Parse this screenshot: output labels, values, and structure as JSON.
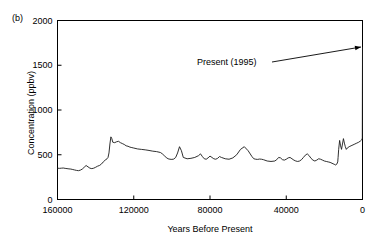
{
  "figure": {
    "panel_label": "(b)",
    "background_color": "#ffffff",
    "line_color": "#1a1a1a",
    "axis_color": "#000000",
    "text_color": "#000000"
  },
  "annotation": {
    "label": "Present (1995)",
    "text_x": 197,
    "text_y": 57,
    "line_from_x": 272,
    "line_from_y": 62,
    "arrow_to_x": 361,
    "arrow_to_y": 47
  },
  "chart_data": {
    "type": "line",
    "title": "",
    "subtitle": "",
    "xlabel": "Years Before Present",
    "ylabel": "Concentration (ppbv)",
    "xlim": [
      160000,
      0
    ],
    "ylim": [
      0,
      2000
    ],
    "x_inverted": true,
    "grid": false,
    "legend": null,
    "xticks": [
      160000,
      120000,
      80000,
      40000,
      0
    ],
    "xtick_labels": [
      "160000",
      "120000",
      "80000",
      "40000",
      "0"
    ],
    "yticks": [
      0,
      500,
      1000,
      1500,
      2000
    ],
    "ytick_labels": [
      "0",
      "500",
      "1000",
      "1500",
      "2000"
    ],
    "tick_direction": "in",
    "annotations": [
      {
        "text": "Present (1995)",
        "points_to_x": 0,
        "points_to_y": 1700
      }
    ],
    "series": [
      {
        "name": "Methane concentration",
        "units": "ppbv",
        "x": [
          160000,
          159000,
          158000,
          157000,
          156000,
          155000,
          154000,
          153000,
          152000,
          151000,
          150000,
          149000,
          148000,
          147000,
          146000,
          145000,
          144000,
          143000,
          142000,
          141000,
          140000,
          139000,
          138000,
          137000,
          136000,
          135000,
          134000,
          133500,
          133000,
          132500,
          132000,
          131500,
          131000,
          130000,
          129000,
          128000,
          127000,
          126000,
          125000,
          124000,
          123000,
          122000,
          121000,
          120000,
          118000,
          116000,
          114000,
          112000,
          110000,
          108000,
          106000,
          105000,
          104000,
          103000,
          102000,
          101000,
          100000,
          99000,
          98000,
          97000,
          96000,
          95000,
          94000,
          92000,
          90000,
          88000,
          86000,
          85000,
          84000,
          83000,
          82000,
          81000,
          80000,
          79000,
          78000,
          77000,
          76000,
          75000,
          74000,
          72000,
          70000,
          68000,
          66000,
          64000,
          62000,
          60000,
          58000,
          57000,
          56000,
          55000,
          54000,
          53000,
          52000,
          50000,
          48000,
          46000,
          45000,
          44000,
          43000,
          42000,
          41000,
          40000,
          39000,
          38000,
          37000,
          36000,
          35000,
          34000,
          33000,
          32000,
          31000,
          30000,
          29000,
          28000,
          27000,
          26000,
          25000,
          24000,
          23000,
          22000,
          21000,
          20000,
          19000,
          18000,
          17000,
          16000,
          15000,
          14500,
          14000,
          13500,
          13000,
          12800,
          12500,
          12000,
          11500,
          11000,
          10500,
          10000,
          9500,
          9000,
          8500,
          8000,
          7000,
          6000,
          5000,
          4000,
          3000,
          2000,
          1000,
          500,
          200,
          100,
          50,
          0
        ],
        "y": [
          350,
          348,
          350,
          352,
          348,
          345,
          342,
          340,
          335,
          330,
          325,
          322,
          328,
          340,
          360,
          380,
          365,
          350,
          345,
          350,
          360,
          372,
          380,
          395,
          420,
          440,
          455,
          470,
          520,
          620,
          700,
          680,
          640,
          635,
          645,
          650,
          635,
          625,
          615,
          600,
          595,
          585,
          580,
          575,
          565,
          560,
          555,
          548,
          540,
          535,
          525,
          510,
          490,
          470,
          455,
          450,
          448,
          452,
          470,
          520,
          590,
          545,
          470,
          455,
          460,
          470,
          490,
          510,
          480,
          455,
          450,
          465,
          485,
          470,
          455,
          450,
          460,
          480,
          470,
          455,
          450,
          465,
          500,
          560,
          590,
          545,
          480,
          455,
          450,
          448,
          452,
          450,
          445,
          430,
          425,
          430,
          445,
          470,
          465,
          445,
          440,
          450,
          465,
          470,
          455,
          440,
          430,
          425,
          430,
          445,
          470,
          495,
          510,
          490,
          460,
          440,
          430,
          440,
          455,
          450,
          440,
          430,
          425,
          420,
          415,
          405,
          395,
          390,
          385,
          395,
          420,
          470,
          560,
          660,
          600,
          560,
          620,
          680,
          630,
          590,
          560,
          575,
          590,
          600,
          610,
          620,
          630,
          640,
          655,
          665,
          675,
          690,
          1200,
          1700
        ]
      }
    ]
  }
}
